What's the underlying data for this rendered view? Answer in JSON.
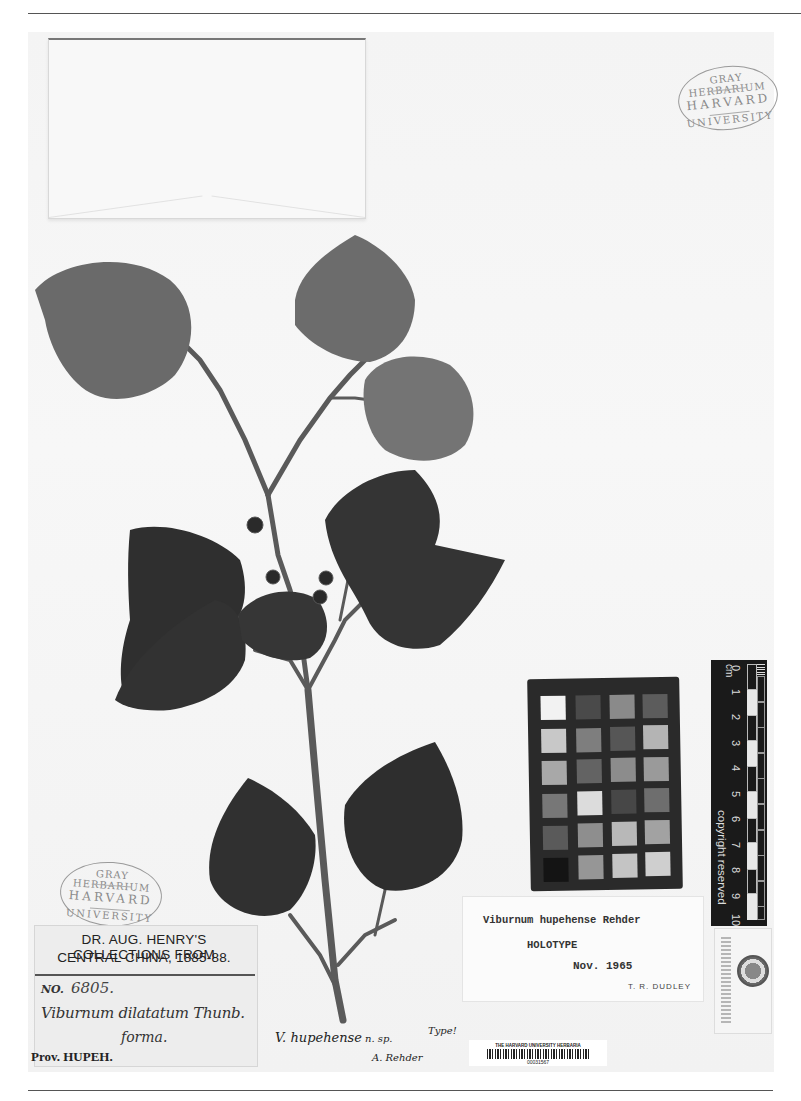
{
  "page": {
    "running_header": "",
    "background": "#ffffff",
    "sheet_color": "#f5f5f5"
  },
  "stamps": {
    "top_right": {
      "line1": "GRAY HERBARIUM",
      "line2": "HARVARD",
      "line3": "UNIVERSITY"
    },
    "bottom_left": {
      "line1": "GRAY HERBARIUM",
      "line2": "HARVARD",
      "line3": "UNIVERSITY"
    }
  },
  "collection_label": {
    "header_line1": "DR. AUG. HENRY'S COLLECTIONS FROM",
    "header_line2": "CENTRAL CHINA, 1885-88.",
    "number_label": "NO.",
    "number_value": "6805.",
    "taxon_name": "Viburnum dilatatum Thunb.",
    "forma": "forma.",
    "province": "Prov. HUPEH."
  },
  "determination_label": {
    "taxon": "Viburnum hupehense Rehder",
    "status": "HOLOTYPE",
    "date": "Nov. 1965",
    "determiner": "T. R. DUDLEY"
  },
  "handwritten_annotation": {
    "name": "V. hupehense",
    "qualifier": "n. sp.",
    "type_note": "Type!",
    "signature": "A. Rehder"
  },
  "barcode_label": {
    "institution": "THE HARVARD UNIVERSITY HERBARIA",
    "number": "00031567"
  },
  "scale_ruler": {
    "unit": "cm",
    "ticks": [
      "0",
      "1",
      "2",
      "3",
      "4",
      "5",
      "6",
      "7",
      "8",
      "9",
      "10"
    ],
    "notice": "copyright reserved"
  },
  "color_chart": {
    "rows": [
      [
        "#f2f2f2",
        "#4a4a4a",
        "#8a8a8a",
        "#5c5c5c"
      ],
      [
        "#c8c8c8",
        "#7e7e7e",
        "#565656",
        "#b4b4b4"
      ],
      [
        "#a8a8a8",
        "#636363",
        "#8c8c8c",
        "#9a9a9a"
      ],
      [
        "#777777",
        "#dcdcdc",
        "#474747",
        "#6e6e6e"
      ],
      [
        "#5a5a5a",
        "#8e8e8e",
        "#b8b8b8",
        "#a2a2a2"
      ],
      [
        "#141414",
        "#969696",
        "#c4c4c4",
        "#cfcfcf"
      ]
    ]
  },
  "specimen": {
    "leaf_color_light": "#6e6e6e",
    "leaf_color_dark": "#2e2e2e",
    "stem_color": "#5a5a5a"
  }
}
